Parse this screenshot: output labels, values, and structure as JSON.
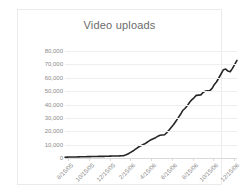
{
  "chart_data": {
    "type": "line",
    "title": "Video uploads",
    "xlabel": "",
    "ylabel": "",
    "ylim": [
      0,
      80000
    ],
    "ytick_labels": [
      "80,000",
      "70,000",
      "60,000",
      "50,000",
      "40,000",
      "30,000",
      "20,000",
      "10,000",
      "0"
    ],
    "ytick_values": [
      80000,
      70000,
      60000,
      50000,
      40000,
      30000,
      20000,
      10000,
      0
    ],
    "xtick_labels": [
      "8/15/05",
      "10/15/05",
      "12/15/05",
      "2/15/06",
      "4/15/06",
      "6/15/06",
      "8/15/06",
      "10/15/06",
      "12/15/06"
    ],
    "grid": true,
    "legend": false,
    "line_color": "#262626",
    "series": [
      {
        "name": "Video uploads",
        "values": [
          600,
          650,
          700,
          720,
          760,
          800,
          840,
          880,
          900,
          950,
          1000,
          1050,
          1080,
          1120,
          1150,
          1180,
          1200,
          1250,
          1300,
          1350,
          1400,
          1450,
          1500,
          1550,
          1600,
          1700,
          1800,
          2400,
          3200,
          4200,
          5200,
          6400,
          7600,
          8800,
          9600,
          10400,
          11400,
          12600,
          13600,
          14400,
          15200,
          16200,
          17000,
          17200,
          17400,
          19000,
          21000,
          23000,
          25000,
          27500,
          30000,
          32500,
          35500,
          37000,
          39000,
          41500,
          43500,
          45000,
          46800,
          47000,
          47200,
          49000,
          50000,
          50200,
          50400,
          52000,
          55000,
          57000,
          60000,
          63000,
          66000,
          66500,
          65000,
          64500,
          67000,
          70000,
          73000
        ]
      }
    ]
  }
}
